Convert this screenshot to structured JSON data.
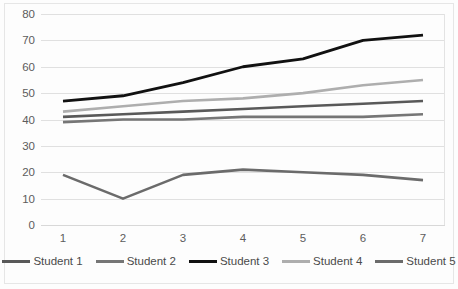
{
  "chart_data": {
    "type": "line",
    "title": "",
    "subtitle": "",
    "xlabel": "",
    "ylabel": "",
    "x": [
      1,
      2,
      3,
      4,
      5,
      6,
      7
    ],
    "categories": [
      "1",
      "2",
      "3",
      "4",
      "5",
      "6",
      "7"
    ],
    "xlim": [
      1,
      7
    ],
    "ylim": [
      0,
      80
    ],
    "ytick_values": [
      80,
      70,
      60,
      50,
      40,
      30,
      20,
      10,
      0
    ],
    "ytick_labels": [
      "80",
      "70",
      "60",
      "50",
      "40",
      "30",
      "20",
      "10",
      "0"
    ],
    "xtick_labels": [
      "1",
      "2",
      "3",
      "4",
      "5",
      "6",
      "7"
    ],
    "grid": "horizontal",
    "legend_position": "bottom",
    "series": [
      {
        "name": "Student 1",
        "color": "#595959",
        "width": 2.6,
        "values": [
          41,
          42,
          43,
          44,
          45,
          46,
          47
        ]
      },
      {
        "name": "Student 2",
        "color": "#767676",
        "width": 2.6,
        "values": [
          39,
          40,
          40,
          41,
          41,
          41,
          42
        ]
      },
      {
        "name": "Student 3",
        "color": "#111111",
        "width": 2.8,
        "values": [
          47,
          49,
          54,
          60,
          63,
          70,
          72
        ]
      },
      {
        "name": "Student 4",
        "color": "#aeaeae",
        "width": 2.6,
        "values": [
          43,
          45,
          47,
          48,
          50,
          53,
          55
        ]
      },
      {
        "name": "Student 5",
        "color": "#6b6b6b",
        "width": 2.6,
        "values": [
          19,
          10,
          19,
          21,
          20,
          19,
          17
        ]
      }
    ]
  },
  "colors": {
    "gridline": "#e0e0e0",
    "tick_text": "#5c5c5c",
    "legend_text": "#4a4a4a",
    "plot_background": "#ffffff",
    "frame": "#e6e6e6"
  }
}
